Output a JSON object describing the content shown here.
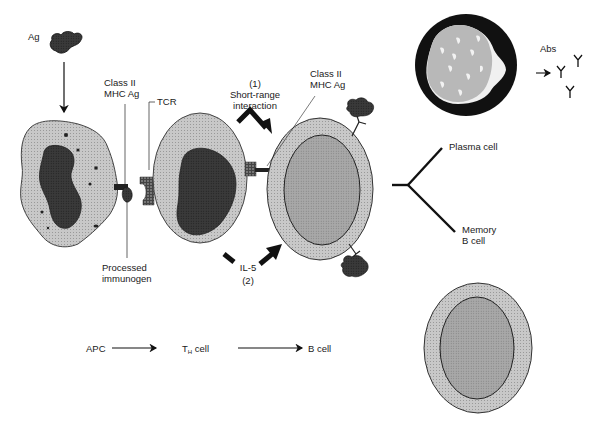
{
  "diagram": {
    "labels": {
      "antigen": "Ag",
      "class2_mhc_left_line1": "Class II",
      "class2_mhc_left_line2": "MHC Ag",
      "tcr": "TCR",
      "processed_line1": "Processed",
      "processed_line2": "immunogen",
      "interaction_num": "(1)",
      "interaction_line1": "Short-range",
      "interaction_line2": "interaction",
      "class2_mhc_right_line1": "Class II",
      "class2_mhc_right_line2": "MHC Ag",
      "il5": "IL-5",
      "il5_num": "(2)",
      "abs": "Abs",
      "plasma_cell": "Plasma cell",
      "memory_line1": "Memory",
      "memory_line2": "B cell"
    },
    "flow": {
      "apc": "APC",
      "th_main": "T",
      "th_sub": "H",
      "th_suffix": " cell",
      "bcell": "B cell"
    },
    "colors": {
      "cell_light": "#c8c8c8",
      "cell_mid": "#a6a6a6",
      "nucleus_dark": "#2a2a2a",
      "nucleus_gray": "#555555",
      "plasma_ring": "#111111",
      "outline": "#222222",
      "background": "#ffffff"
    }
  }
}
